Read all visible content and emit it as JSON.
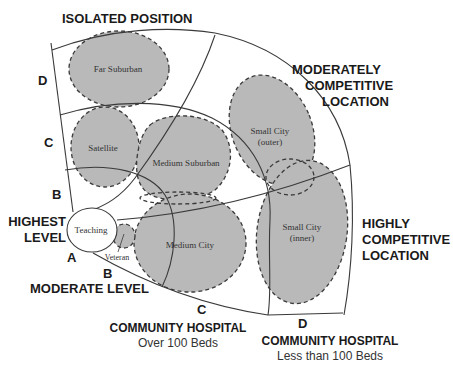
{
  "title_top": "ISOLATED POSITION",
  "moderately_competitive": [
    "MODERATELY",
    "COMPETITIVE",
    "LOCATION"
  ],
  "highly_competitive": [
    "HIGHLY",
    "COMPETITIVE",
    "LOCATION"
  ],
  "highest_level": [
    "HIGHEST",
    "LEVEL"
  ],
  "moderate_level": "MODERATE LEVEL",
  "community_over": {
    "title": "COMMUNITY HOSPITAL",
    "subtitle": "Over 100 Beds"
  },
  "community_under": {
    "title": "COMMUNITY HOSPITAL",
    "subtitle": "Less than 100 Beds"
  },
  "left_letters": [
    "D",
    "C",
    "B",
    "A"
  ],
  "bottom_letters": [
    "B",
    "C",
    "D"
  ],
  "regions": {
    "far_suburban": "Far Suburban",
    "satellite": "Satellite",
    "medium_suburban": "Medium Suburban",
    "small_city_outer": [
      "Small City",
      "(outer)"
    ],
    "small_city_inner": [
      "Small City",
      "(inner)"
    ],
    "medium_city": "Medium City",
    "teaching": "Teaching",
    "veteran": "Veteran"
  },
  "colors": {
    "blob_fill": "#b9b9b9",
    "line": "#3a3a3a",
    "teaching_fill": "#ffffff"
  }
}
